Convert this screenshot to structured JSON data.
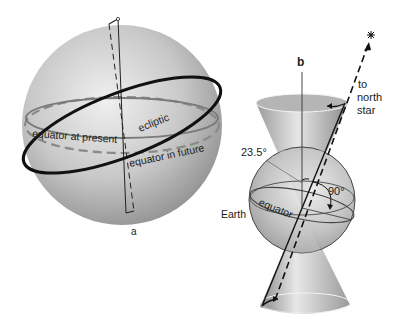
{
  "figure_a": {
    "panel_label": "a",
    "labels": {
      "equator_present": "equator at present",
      "ecliptic": "ecliptic",
      "equator_future": "equator in future"
    }
  },
  "figure_b": {
    "panel_label": "b",
    "labels": {
      "angle_tilt": "23.5°",
      "angle_right": "90°",
      "earth": "Earth",
      "equator": "equator",
      "to": "to",
      "north": "north",
      "star": "star"
    },
    "icons": {
      "star": "star-icon"
    }
  },
  "colors": {
    "sphere_light": "#e4e4e4",
    "sphere_dark": "#8c8c8c",
    "ecliptic": "#111111",
    "equator_line": "#808080"
  }
}
